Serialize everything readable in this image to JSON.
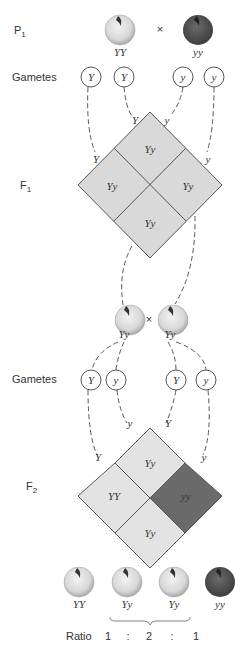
{
  "generations": {
    "p1": {
      "label": "P",
      "sub": "1"
    },
    "f1": {
      "label": "F",
      "sub": "1"
    },
    "f2": {
      "label": "F",
      "sub": "2"
    }
  },
  "cross_symbol": "×",
  "p1": {
    "parents": [
      {
        "genotype": "YY",
        "color": "yellow"
      },
      {
        "genotype": "yy",
        "color": "green"
      }
    ],
    "gametes_label": "Gametes",
    "gametes": [
      "Y",
      "Y",
      "y",
      "y"
    ]
  },
  "f1": {
    "square_edge_labels": [
      "Y",
      "Y",
      "y",
      "y"
    ],
    "cells": [
      "Yy",
      "Yy",
      "Yy",
      "Yy"
    ],
    "parents": [
      {
        "genotype": "Yy"
      },
      {
        "genotype": "Yy"
      }
    ],
    "gametes_label": "Gametes",
    "gametes": [
      "Y",
      "y",
      "Y",
      "y"
    ]
  },
  "f2": {
    "square_edge_labels": [
      "Y",
      "y",
      "Y",
      "y"
    ],
    "cells": {
      "top": "Yy",
      "left": "YY",
      "right": "yy",
      "bottom": "Yy"
    },
    "offspring": [
      {
        "genotype": "YY",
        "color": "yellow"
      },
      {
        "genotype": "Yy",
        "color": "yellow"
      },
      {
        "genotype": "Yy",
        "color": "yellow"
      },
      {
        "genotype": "yy",
        "color": "green"
      }
    ],
    "ratio_label": "Ratio",
    "ratio": [
      "1",
      ":",
      "2",
      ":",
      "1"
    ]
  },
  "colors": {
    "light_cell": "#d9d9d9",
    "f2_light_cell": "#e3e3e3",
    "dark_cell": "#6a6a6a",
    "light_seed": "#e6e6e6",
    "dark_seed": "#555555",
    "line": "#555555"
  }
}
